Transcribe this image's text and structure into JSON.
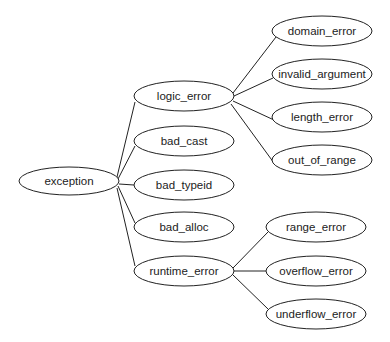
{
  "diagram": {
    "type": "tree",
    "colors": {
      "stroke": "#222222",
      "fill": "#ffffff",
      "text": "#222222",
      "background": "#ffffff"
    },
    "nodes": [
      {
        "id": "exception",
        "label": "exception",
        "cx": 69,
        "cy": 181,
        "rx": 50,
        "ry": 14
      },
      {
        "id": "logic_error",
        "label": "logic_error",
        "cx": 184,
        "cy": 96,
        "rx": 50,
        "ry": 15
      },
      {
        "id": "bad_cast",
        "label": "bad_cast",
        "cx": 184,
        "cy": 141,
        "rx": 50,
        "ry": 15
      },
      {
        "id": "bad_typeid",
        "label": "bad_typeid",
        "cx": 184,
        "cy": 185,
        "rx": 50,
        "ry": 15
      },
      {
        "id": "bad_alloc",
        "label": "bad_alloc",
        "cx": 184,
        "cy": 227,
        "rx": 50,
        "ry": 15
      },
      {
        "id": "runtime_error",
        "label": "runtime_error",
        "cx": 184,
        "cy": 271,
        "rx": 50,
        "ry": 15
      },
      {
        "id": "domain_error",
        "label": "domain_error",
        "cx": 322,
        "cy": 31,
        "rx": 50,
        "ry": 15
      },
      {
        "id": "invalid_argument",
        "label": "invalid_argument",
        "cx": 322,
        "cy": 74,
        "rx": 50,
        "ry": 15
      },
      {
        "id": "length_error",
        "label": "length_error",
        "cx": 322,
        "cy": 117,
        "rx": 50,
        "ry": 15
      },
      {
        "id": "out_of_range",
        "label": "out_of_range",
        "cx": 322,
        "cy": 160,
        "rx": 50,
        "ry": 15
      },
      {
        "id": "range_error",
        "label": "range_error",
        "cx": 316,
        "cy": 227,
        "rx": 50,
        "ry": 15
      },
      {
        "id": "overflow_error",
        "label": "overflow_error",
        "cx": 316,
        "cy": 271,
        "rx": 50,
        "ry": 15
      },
      {
        "id": "underflow_error",
        "label": "underflow_error",
        "cx": 316,
        "cy": 314,
        "rx": 50,
        "ry": 15
      }
    ],
    "edges": [
      {
        "from": "exception",
        "to": "logic_error",
        "x1": 117,
        "y1": 177,
        "x2": 135,
        "y2": 102
      },
      {
        "from": "exception",
        "to": "bad_cast",
        "x1": 118,
        "y1": 179,
        "x2": 135,
        "y2": 146
      },
      {
        "from": "exception",
        "to": "bad_typeid",
        "x1": 119,
        "y1": 184,
        "x2": 134,
        "y2": 185
      },
      {
        "from": "exception",
        "to": "bad_alloc",
        "x1": 118,
        "y1": 186,
        "x2": 135,
        "y2": 223
      },
      {
        "from": "exception",
        "to": "runtime_error",
        "x1": 117,
        "y1": 188,
        "x2": 135,
        "y2": 266
      },
      {
        "from": "logic_error",
        "to": "domain_error",
        "x1": 233,
        "y1": 93,
        "x2": 276,
        "y2": 37
      },
      {
        "from": "logic_error",
        "to": "invalid_argument",
        "x1": 234,
        "y1": 96,
        "x2": 273,
        "y2": 78
      },
      {
        "from": "logic_error",
        "to": "length_error",
        "x1": 233,
        "y1": 101,
        "x2": 274,
        "y2": 120
      },
      {
        "from": "logic_error",
        "to": "out_of_range",
        "x1": 231,
        "y1": 104,
        "x2": 274,
        "y2": 163
      },
      {
        "from": "runtime_error",
        "to": "range_error",
        "x1": 233,
        "y1": 268,
        "x2": 268,
        "y2": 232
      },
      {
        "from": "runtime_error",
        "to": "overflow_error",
        "x1": 234,
        "y1": 271,
        "x2": 266,
        "y2": 271
      },
      {
        "from": "runtime_error",
        "to": "underflow_error",
        "x1": 233,
        "y1": 275,
        "x2": 268,
        "y2": 309
      }
    ]
  }
}
